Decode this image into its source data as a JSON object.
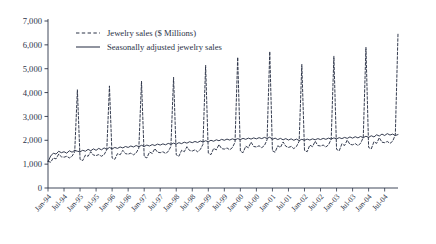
{
  "chart_data": {
    "type": "line",
    "title": "",
    "xlabel": "",
    "ylabel": "",
    "ylim": [
      0,
      7000
    ],
    "ytick_labels": [
      "0",
      "1,000",
      "2,000",
      "3,000",
      "4,000",
      "5,000",
      "6,000",
      "7,000"
    ],
    "ytick_values": [
      0,
      1000,
      2000,
      3000,
      4000,
      5000,
      6000,
      7000
    ],
    "grid": false,
    "legend_position": "top-left",
    "legend": [
      {
        "label": "Jewelry sales ($ Millions)",
        "style": "dashed",
        "color": "#2b3347"
      },
      {
        "label": "Seasonally adjusted jewelry sales",
        "style": "solid",
        "color": "#2b3347"
      }
    ],
    "xtick_labels": [
      "Jan-94",
      "Jul-94",
      "Jan-95",
      "Jul-95",
      "Jan-96",
      "Jul-96",
      "Jan-97",
      "Jul-97",
      "Jan-98",
      "Jul-98",
      "Jan-99",
      "Jul-99",
      "Jan-00",
      "Jul-00",
      "Jan-01",
      "Jul-01",
      "Jan-02",
      "Jul-02",
      "Jan-03",
      "Jul-03",
      "Jan-04",
      "Jul-04"
    ],
    "x_start": "Jan-94",
    "x_end": "Dec-04",
    "x_frequency": "monthly",
    "series": [
      {
        "name": "Jewelry sales ($ Millions)",
        "style": "dashed",
        "values": [
          1120,
          1080,
          1260,
          1220,
          1420,
          1310,
          1290,
          1330,
          1260,
          1330,
          1520,
          4120,
          1200,
          1150,
          1380,
          1330,
          1520,
          1380,
          1360,
          1400,
          1330,
          1400,
          1600,
          4280,
          1260,
          1200,
          1440,
          1390,
          1580,
          1440,
          1420,
          1460,
          1390,
          1470,
          1670,
          4480,
          1320,
          1260,
          1510,
          1450,
          1650,
          1500,
          1480,
          1520,
          1450,
          1530,
          1740,
          4640,
          1390,
          1330,
          1580,
          1520,
          1730,
          1570,
          1550,
          1600,
          1520,
          1610,
          1830,
          5140,
          1460,
          1400,
          1660,
          1600,
          1820,
          1650,
          1630,
          1680,
          1600,
          1690,
          1920,
          5480,
          1540,
          1480,
          1750,
          1690,
          1920,
          1740,
          1720,
          1770,
          1690,
          1780,
          2020,
          5720,
          1560,
          1500,
          1770,
          1700,
          1930,
          1750,
          1700,
          1740,
          1650,
          1740,
          1960,
          5180,
          1580,
          1520,
          1800,
          1730,
          1960,
          1780,
          1760,
          1800,
          1720,
          1810,
          2050,
          5520,
          1620,
          1560,
          1850,
          1780,
          2010,
          1830,
          1810,
          1860,
          1780,
          1870,
          2120,
          5900,
          1700,
          1640,
          1940,
          1870,
          2110,
          1920,
          1900,
          1950,
          1870,
          1960,
          2230,
          6480
        ]
      },
      {
        "name": "Seasonally adjusted jewelry sales",
        "style": "solid",
        "values": [
          1100,
          1340,
          1460,
          1420,
          1540,
          1480,
          1520,
          1460,
          1560,
          1500,
          1580,
          1540,
          1520,
          1580,
          1540,
          1620,
          1560,
          1640,
          1580,
          1660,
          1600,
          1680,
          1620,
          1700,
          1640,
          1700,
          1660,
          1720,
          1680,
          1740,
          1700,
          1760,
          1720,
          1780,
          1730,
          1790,
          1740,
          1800,
          1760,
          1820,
          1780,
          1840,
          1800,
          1850,
          1810,
          1870,
          1830,
          1880,
          1840,
          1900,
          1860,
          1920,
          1880,
          1940,
          1900,
          1950,
          1910,
          1970,
          1930,
          1980,
          1940,
          2000,
          1960,
          2020,
          1980,
          2040,
          2000,
          2050,
          2010,
          2060,
          2020,
          2070,
          2030,
          2080,
          2040,
          2090,
          2050,
          2100,
          2060,
          2110,
          2070,
          2120,
          2080,
          2130,
          2040,
          2090,
          2030,
          2080,
          2020,
          2070,
          2010,
          2060,
          2000,
          2050,
          1990,
          2040,
          2000,
          2050,
          2010,
          2060,
          2020,
          2070,
          2030,
          2080,
          2040,
          2090,
          2050,
          2100,
          2060,
          2110,
          2070,
          2120,
          2080,
          2140,
          2090,
          2150,
          2100,
          2160,
          2110,
          2170,
          2120,
          2190,
          2140,
          2230,
          2180,
          2260,
          2200,
          2280,
          2220,
          2260,
          2200,
          2240
        ]
      }
    ]
  }
}
